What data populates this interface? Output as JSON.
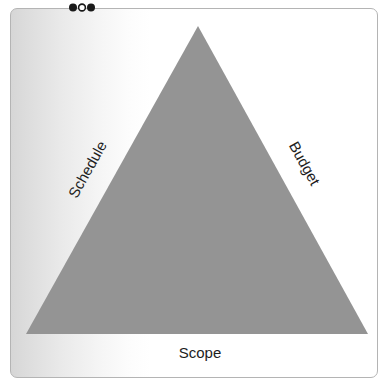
{
  "diagram": {
    "name": "project-management-triangle",
    "vertices": {
      "apex": [
        198,
        26
      ],
      "bottom_left": [
        26,
        334
      ],
      "bottom_right": [
        368,
        334
      ]
    },
    "fill_color": "#949494",
    "labels": {
      "left": "Schedule",
      "right": "Budget",
      "bottom": "Scope"
    },
    "label_rotation": {
      "left": -60.8,
      "right": 60.8,
      "bottom": 0
    },
    "label_positions": {
      "left": [
        92,
        172
      ],
      "right": [
        300,
        166
      ],
      "bottom": [
        200,
        358
      ]
    }
  },
  "card": {
    "border_color": "#b4b4b4",
    "gradient_from": "#d6d6d6",
    "gradient_to": "#ffffff"
  },
  "handles": {
    "dots": [
      {
        "name": "handle-dot-left",
        "style": "filled",
        "cx": 5,
        "cy": 5.5,
        "r": 4
      },
      {
        "name": "handle-dot-middle",
        "style": "hollow",
        "cx": 14,
        "cy": 5.5,
        "r": 4
      },
      {
        "name": "handle-dot-right",
        "style": "filled",
        "cx": 23,
        "cy": 5.5,
        "r": 4
      }
    ],
    "dot_color": "#1a1a1a"
  }
}
